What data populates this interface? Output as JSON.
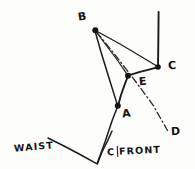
{
  "sketch": {
    "title": "Dart manipulation pattern sketch",
    "background_color": "#fdfdfc",
    "ink_color": "#1b1b1b"
  },
  "labels": {
    "point_b": "B",
    "point_c": "C",
    "point_e": "E",
    "point_a": "A",
    "point_d": "D",
    "waist": "WAIST",
    "cfront_left": "C",
    "cfront_right": "FRONT"
  },
  "points": {
    "B": {
      "x": 95,
      "y": 30,
      "label_x": 78,
      "label_y": 11
    },
    "C": {
      "x": 158,
      "y": 67,
      "label_x": 168,
      "label_y": 60
    },
    "E": {
      "x": 128,
      "y": 76,
      "label_x": 139,
      "label_y": 76
    },
    "A": {
      "x": 118,
      "y": 106,
      "label_x": 122,
      "label_y": 108
    },
    "D": {
      "x": 168,
      "y": 131,
      "label_x": 171,
      "label_y": 126
    },
    "waist_left": {
      "x": 48,
      "y": 138
    },
    "waist_vertex": {
      "x": 97,
      "y": 164
    },
    "cfront_top": {
      "x": 112,
      "y": 131
    },
    "vertical_top": {
      "x": 158,
      "y": 12
    }
  },
  "segments": [
    {
      "name": "vertical-guide",
      "from": "vertical_top",
      "to": "C",
      "style": "solid",
      "weight": "heavy"
    },
    {
      "name": "segment-b-to-c",
      "from": "B",
      "to": "C",
      "style": "solid",
      "weight": "thin"
    },
    {
      "name": "segment-b-to-e",
      "from": "B",
      "to": "E",
      "style": "solid",
      "weight": "thin"
    },
    {
      "name": "segment-b-to-a",
      "from": "B",
      "to": "A",
      "style": "solid",
      "weight": "medium"
    },
    {
      "name": "segment-e-to-c",
      "from": "E",
      "to": "C",
      "style": "solid",
      "weight": "heavy"
    },
    {
      "name": "segment-a-to-e",
      "from": "A",
      "to": "E",
      "style": "solid",
      "weight": "heavy"
    },
    {
      "name": "segment-a-to-waist-vertex",
      "from": "A",
      "to": "waist_vertex",
      "style": "solid",
      "weight": "medium"
    },
    {
      "name": "waist-line",
      "from": "waist_left",
      "to": "waist_vertex",
      "style": "solid",
      "weight": "medium"
    },
    {
      "name": "cfront-line",
      "from": "waist_vertex",
      "to": "cfront_top",
      "style": "solid",
      "weight": "medium"
    },
    {
      "name": "dart-axis-b-to-d",
      "from": "B",
      "to": "D",
      "style": "dashdot",
      "weight": "thin"
    }
  ],
  "node_dots": [
    "B",
    "C",
    "E",
    "A"
  ]
}
